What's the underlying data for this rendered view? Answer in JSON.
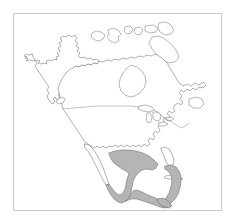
{
  "figure": {
    "type": "distribution-range-map",
    "title": "",
    "caption": "",
    "background_color": "#ffffff",
    "width_px": 236,
    "height_px": 221
  },
  "frame": {
    "visible": true,
    "border_color": "#c9c9c9",
    "border_width_px": 1,
    "left_px": 13,
    "top_px": 13,
    "width_px": 209,
    "height_px": 198
  },
  "map": {
    "region_label": "North America",
    "projection_hint": "equal-area / conic",
    "coastline_color": "#6e6e6e",
    "land_fill_color": "#ffffff",
    "internal_border_color": "#7a7a7a",
    "shaded_range_fill": "#b5b5b5",
    "shaded_range_outline": "#6a6a6a",
    "features": [
      {
        "name": "north-america-mainland",
        "kind": "coastline",
        "shaded": false
      },
      {
        "name": "alaska",
        "kind": "coastline",
        "shaded": false
      },
      {
        "name": "canada-arctic-archipelago",
        "kind": "island-group",
        "shaded": false
      },
      {
        "name": "baffin-island",
        "kind": "island",
        "shaded": false
      },
      {
        "name": "hudson-bay",
        "kind": "inland-sea",
        "shaded": false
      },
      {
        "name": "great-lakes",
        "kind": "lake-group",
        "shaded": false
      },
      {
        "name": "newfoundland",
        "kind": "island",
        "shaded": false
      },
      {
        "name": "vancouver-island",
        "kind": "island",
        "shaded": false
      },
      {
        "name": "baja-california",
        "kind": "peninsula",
        "shaded": false
      },
      {
        "name": "florida-peninsula",
        "kind": "peninsula",
        "shaded": false
      },
      {
        "name": "cuba",
        "kind": "island",
        "shaded": false
      },
      {
        "name": "usa-canada-border",
        "kind": "internal-border",
        "shaded": false
      },
      {
        "name": "usa-mexico-border",
        "kind": "internal-border",
        "shaded": false
      },
      {
        "name": "mexico-range",
        "kind": "shaded-range",
        "shaded": true
      },
      {
        "name": "yucatan-range",
        "kind": "shaded-range",
        "shaded": true
      },
      {
        "name": "central-america-range",
        "kind": "shaded-range",
        "shaded": true
      }
    ],
    "legend": {
      "visible": false,
      "entries": []
    },
    "axes": {
      "visible": false,
      "x_ticks": [],
      "y_ticks": []
    }
  }
}
